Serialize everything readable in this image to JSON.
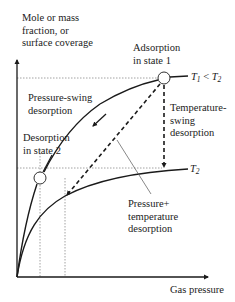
{
  "diagram": {
    "type": "adsorption isotherm schematic",
    "y_axis_label": [
      "Mole or mass",
      "fraction, or",
      "surface coverage"
    ],
    "x_axis_label": "Gas pressure",
    "curves": [
      {
        "name": "T1",
        "label": "T1 < T2",
        "label_parts": {
          "t1": "T",
          "t1_sub": "1",
          "lt": " < ",
          "t2": "T",
          "t2_sub": "2"
        }
      },
      {
        "name": "T2",
        "label_parts": {
          "t": "T",
          "sub": "2"
        }
      }
    ],
    "states": [
      {
        "id": "state1",
        "label": [
          "Adsorption",
          "in state 1"
        ]
      },
      {
        "id": "state2",
        "label": [
          "Desorption",
          "in state 2"
        ]
      }
    ],
    "processes": [
      {
        "id": "pressure-swing",
        "label": [
          "Pressure-swing",
          "desorption"
        ]
      },
      {
        "id": "temperature-swing",
        "label": [
          "Temperature-",
          "swing",
          "desorption"
        ]
      },
      {
        "id": "pressure-temperature",
        "label": [
          "Pressure+",
          "temperature",
          "desorption"
        ]
      }
    ],
    "colors": {
      "line": "#1a1a1a",
      "guide": "#888888",
      "text": "#222222"
    }
  }
}
